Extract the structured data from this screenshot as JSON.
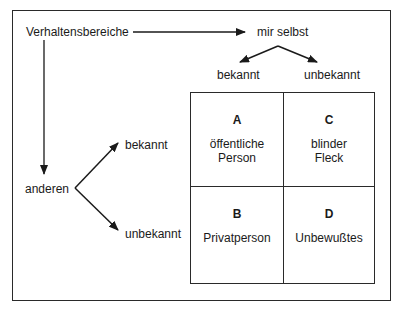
{
  "diagram": {
    "type": "johari-window",
    "root_label": "Verhaltensbereiche",
    "axis_self": {
      "label": "mir selbst",
      "known": "bekannt",
      "unknown": "unbekannt"
    },
    "axis_others": {
      "label": "anderen",
      "known": "bekannt",
      "unknown": "unbekannt"
    },
    "quadrants": [
      {
        "letter": "A",
        "line1": "öffentliche",
        "line2": "Person"
      },
      {
        "letter": "C",
        "line1": "blinder",
        "line2": "Fleck"
      },
      {
        "letter": "B",
        "line1": "Privatperson",
        "line2": ""
      },
      {
        "letter": "D",
        "line1": "Unbewußtes",
        "line2": ""
      }
    ],
    "colors": {
      "line": "#2a2a2a",
      "text": "#1a1a1a",
      "background": "#ffffff"
    }
  }
}
